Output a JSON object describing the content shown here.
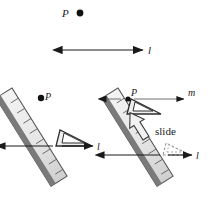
{
  "figure": {
    "type": "geometric-construction-diagram",
    "panels": [
      {
        "id": "given",
        "name": "given-construction",
        "elements": [
          {
            "name": "point-p",
            "label": "P",
            "kind": "labeled-point"
          },
          {
            "name": "line-l",
            "label": "l",
            "kind": "double-headed-arrow-line"
          }
        ]
      },
      {
        "id": "step-1",
        "name": "align-step",
        "elements": [
          {
            "name": "ruler",
            "label": "",
            "kind": "ruler"
          },
          {
            "name": "set-square",
            "label": "",
            "kind": "triangle"
          },
          {
            "name": "point-p",
            "label": "P",
            "kind": "labeled-point"
          },
          {
            "name": "line-l",
            "label": "l",
            "kind": "double-headed-arrow-line"
          }
        ]
      },
      {
        "id": "step-2",
        "name": "slide-step",
        "elements": [
          {
            "name": "ruler",
            "label": "",
            "kind": "ruler"
          },
          {
            "name": "set-square-moved",
            "label": "",
            "kind": "triangle"
          },
          {
            "name": "set-square-ghost",
            "label": "",
            "kind": "triangle-dashed"
          },
          {
            "name": "point-p",
            "label": "P",
            "kind": "labeled-point"
          },
          {
            "name": "line-m",
            "label": "m",
            "kind": "arrow-line"
          },
          {
            "name": "line-l",
            "label": "l",
            "kind": "double-headed-arrow-line"
          },
          {
            "name": "slide-arrow",
            "label": "slide",
            "kind": "block-arrow"
          }
        ]
      }
    ],
    "labels": {
      "point_p": "P",
      "line_l": "l",
      "line_m": "m",
      "slide": "slide"
    },
    "colors": {
      "ink": "#1a1a1a",
      "ruler_fill": "#e9e9e9",
      "ruler_edge": "#4d4d4d",
      "ruler_band": "#6e6e6e",
      "triangle_fill": "#f2f2f2",
      "triangle_edge": "#3a3a3a",
      "ghost_edge": "#8c8c8c",
      "arrow_fill": "#f0f0f0",
      "background": "#ffffff"
    }
  }
}
